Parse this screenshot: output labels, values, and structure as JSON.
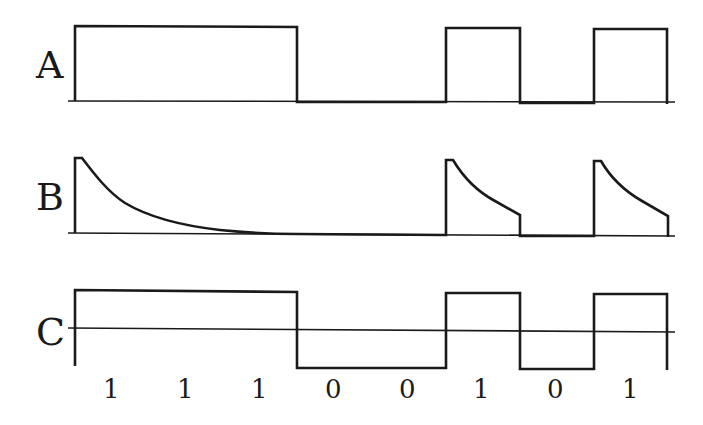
{
  "signals": [
    {
      "label": "A",
      "description": "Unipolar NRZ square wave"
    },
    {
      "label": "B",
      "description": "RC-decayed response (exponential decay during high bits)"
    },
    {
      "label": "C",
      "description": "Bipolar NRZ square wave about zero axis"
    }
  ],
  "bits": [
    "1",
    "1",
    "1",
    "0",
    "0",
    "1",
    "0",
    "1"
  ],
  "colors": {
    "ink": "#1a1a1a",
    "background": "#ffffff"
  }
}
